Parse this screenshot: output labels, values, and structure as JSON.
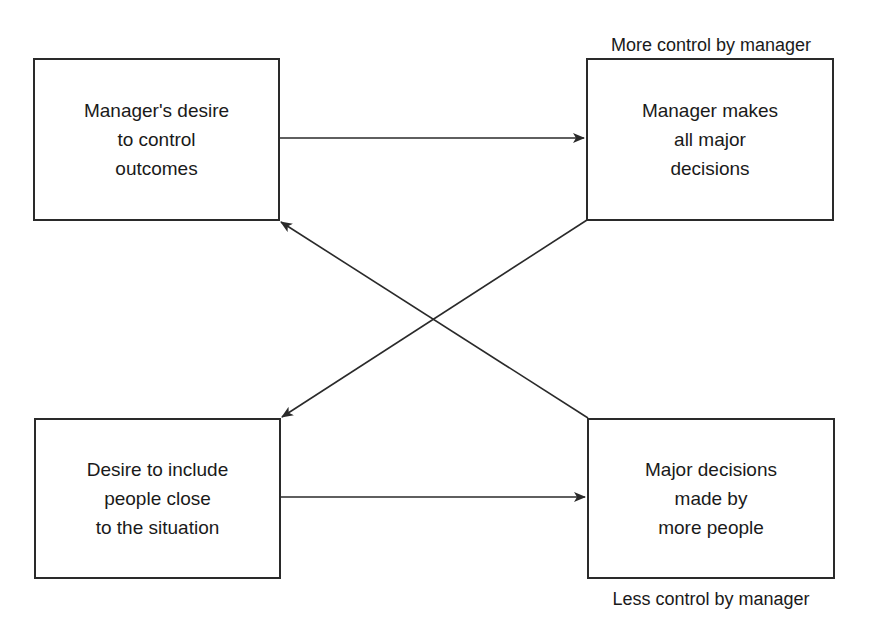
{
  "diagram": {
    "type": "flow-diagram",
    "nodes": [
      {
        "id": "tl",
        "label": "Manager's desire\nto control\noutcomes"
      },
      {
        "id": "tr",
        "label": "Manager makes\nall major\ndecisions"
      },
      {
        "id": "bl",
        "label": "Desire to include\npeople close\nto the situation"
      },
      {
        "id": "br",
        "label": "Major decisions\nmade by\nmore people"
      }
    ],
    "captions": {
      "top": "More control by manager",
      "bottom": "Less control by manager"
    },
    "edges": [
      {
        "from": "tl",
        "to": "tr",
        "kind": "horizontal-arrow"
      },
      {
        "from": "bl",
        "to": "br",
        "kind": "horizontal-arrow"
      },
      {
        "from": "tr",
        "to": "bl",
        "kind": "diagonal-arrow"
      },
      {
        "from": "br",
        "to": "tl",
        "kind": "diagonal-arrow"
      }
    ],
    "colors": {
      "line": "#2a2a2a",
      "text": "#1a1a1a",
      "background": "#ffffff"
    }
  }
}
